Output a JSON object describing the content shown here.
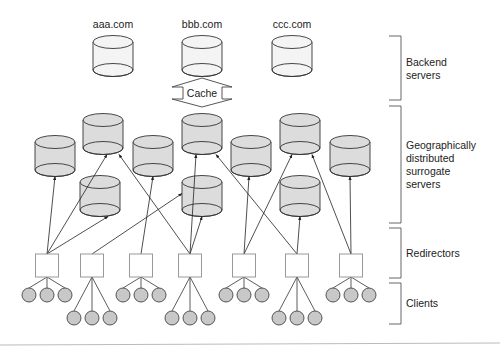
{
  "diagram": {
    "backend_labels": [
      "aaa.com",
      "bbb.com",
      "ccc.com"
    ],
    "cache_label": "Cache",
    "tiers": [
      {
        "id": "backend",
        "lines": [
          "Backend",
          "servers"
        ]
      },
      {
        "id": "surrogate",
        "lines": [
          "Geographically",
          "distributed",
          "surrogate",
          "servers"
        ]
      },
      {
        "id": "redirectors",
        "lines": [
          "Redirectors"
        ]
      },
      {
        "id": "clients",
        "lines": [
          "Clients"
        ]
      }
    ],
    "colors": {
      "backend_fill": "#f4f4f4",
      "surrogate_fill": "#dcdcdc",
      "client_fill": "#c8c8c8",
      "redirector_fill": "#ffffff",
      "stroke": "#333333"
    },
    "node_counts": {
      "backend_servers": 3,
      "surrogate_servers": 10,
      "redirectors": 7,
      "clients": 21
    }
  }
}
